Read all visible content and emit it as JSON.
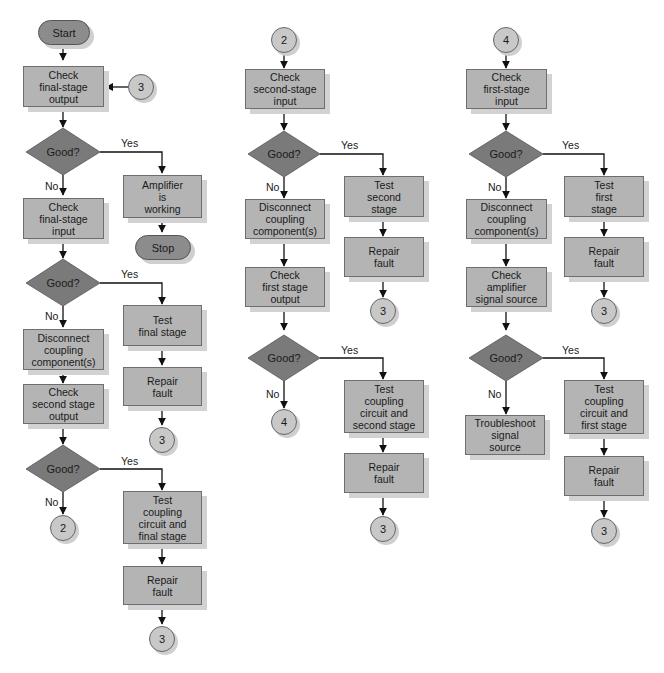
{
  "flowchart": {
    "column1": {
      "start": "Start",
      "check_final_output": "Check\nfinal-stage\noutput",
      "connector_in": "3",
      "decision1": "Good?",
      "decision1_yes": "Yes",
      "decision1_no": "No",
      "amplifier_working": "Amplifier\nis\nworking",
      "stop": "Stop",
      "check_final_input": "Check\nfinal-stage\ninput",
      "decision2": "Good?",
      "decision2_yes": "Yes",
      "decision2_no": "No",
      "test_final_stage": "Test\nfinal stage",
      "repair1": "Repair\nfault",
      "connector_repair1": "3",
      "disconnect": "Disconnect\ncoupling\ncomponent(s)",
      "check_second_output": "Check\nsecond stage\noutput",
      "decision3": "Good?",
      "decision3_yes": "Yes",
      "decision3_no": "No",
      "connector_out": "2",
      "test_coupling_final": "Test\ncoupling\ncircuit and\nfinal stage",
      "repair2": "Repair\nfault",
      "connector_repair2": "3"
    },
    "column2": {
      "connector_in": "2",
      "check_second_input": "Check\nsecond-stage\ninput",
      "decision1": "Good?",
      "decision1_yes": "Yes",
      "decision1_no": "No",
      "test_second_stage": "Test\nsecond\nstage",
      "repair1": "Repair\nfault",
      "connector_repair1": "3",
      "disconnect": "Disconnect\ncoupling\ncomponent(s)",
      "check_first_output": "Check\nfirst stage\noutput",
      "decision2": "Good?",
      "decision2_yes": "Yes",
      "decision2_no": "No",
      "connector_out": "4",
      "test_coupling_second": "Test\ncoupling\ncircuit and\nsecond stage",
      "repair2": "Repair\nfault",
      "connector_repair2": "3"
    },
    "column3": {
      "connector_in": "4",
      "check_first_input": "Check\nfirst-stage\ninput",
      "decision1": "Good?",
      "decision1_yes": "Yes",
      "decision1_no": "No",
      "test_first_stage": "Test\nfirst\nstage",
      "repair1": "Repair\nfault",
      "connector_repair1": "3",
      "disconnect": "Disconnect\ncoupling\ncomponent(s)",
      "check_signal_source": "Check\namplifier\nsignal source",
      "decision2": "Good?",
      "decision2_yes": "Yes",
      "decision2_no": "No",
      "troubleshoot_source": "Troubleshoot\nsignal\nsource",
      "test_coupling_first": "Test\ncoupling\ncircuit and\nfirst stage",
      "repair2": "Repair\nfault",
      "connector_repair2": "3"
    },
    "colors": {
      "process_fill": "#b4b4b4",
      "decision_fill": "#7a7a7a",
      "terminal_fill": "#8c8c8c",
      "connector_fill": "#c8c8c8",
      "line": "#111111"
    }
  }
}
